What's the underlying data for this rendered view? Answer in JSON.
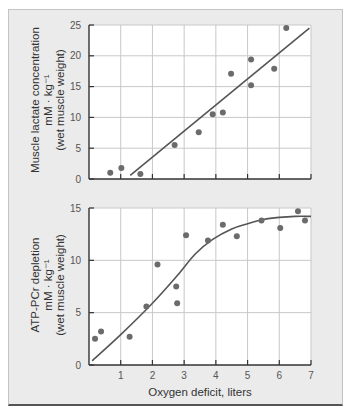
{
  "chart_data": [
    {
      "type": "scatter",
      "title": "",
      "xlabel": "Oxygen deficit, liters",
      "ylabel": [
        "Muscle lactate concentration",
        "mM · kg⁻¹",
        "(wet muscle weight)"
      ],
      "xlim": [
        0,
        7
      ],
      "ylim": [
        0,
        25
      ],
      "xticks": [
        0,
        1,
        2,
        3,
        4,
        5,
        6,
        7
      ],
      "yticks": [
        0,
        5,
        10,
        15,
        20,
        25
      ],
      "ytick_labels": [
        "0",
        "5",
        "10",
        "15",
        "20",
        "25"
      ],
      "show_xtick_labels": false,
      "grid": true,
      "points": [
        {
          "x": 0.67,
          "y": 1.0
        },
        {
          "x": 1.02,
          "y": 1.8
        },
        {
          "x": 1.62,
          "y": 0.8
        },
        {
          "x": 2.7,
          "y": 5.5
        },
        {
          "x": 3.46,
          "y": 7.6
        },
        {
          "x": 3.9,
          "y": 10.5
        },
        {
          "x": 4.22,
          "y": 10.8
        },
        {
          "x": 4.48,
          "y": 17.1
        },
        {
          "x": 5.11,
          "y": 19.4
        },
        {
          "x": 5.11,
          "y": 15.2
        },
        {
          "x": 5.84,
          "y": 17.9
        },
        {
          "x": 6.22,
          "y": 24.5
        }
      ],
      "fit": {
        "type": "linear",
        "points": [
          {
            "x": 1.3,
            "y": 0.6
          },
          {
            "x": 6.95,
            "y": 24.5
          }
        ]
      }
    },
    {
      "type": "scatter",
      "title": "",
      "xlabel": "Oxygen deficit, liters",
      "ylabel": [
        "ATP-PCr depletion",
        "mM · kg⁻¹",
        "(wet muscle weight)"
      ],
      "xlim": [
        0,
        7
      ],
      "ylim": [
        0,
        15
      ],
      "xticks": [
        0,
        1,
        2,
        3,
        4,
        5,
        6,
        7
      ],
      "xtick_labels": [
        "1",
        "2",
        "3",
        "4",
        "5",
        "6",
        "7"
      ],
      "yticks": [
        0,
        5,
        10,
        15
      ],
      "ytick_labels": [
        "0",
        "5",
        "10",
        "15"
      ],
      "grid": true,
      "points": [
        {
          "x": 0.19,
          "y": 2.5
        },
        {
          "x": 0.38,
          "y": 3.2
        },
        {
          "x": 1.28,
          "y": 2.7
        },
        {
          "x": 1.81,
          "y": 5.6
        },
        {
          "x": 2.16,
          "y": 9.6
        },
        {
          "x": 2.75,
          "y": 7.5
        },
        {
          "x": 2.78,
          "y": 5.9
        },
        {
          "x": 3.06,
          "y": 12.4
        },
        {
          "x": 3.75,
          "y": 11.9
        },
        {
          "x": 4.22,
          "y": 13.4
        },
        {
          "x": 4.66,
          "y": 12.3
        },
        {
          "x": 5.44,
          "y": 13.8
        },
        {
          "x": 6.03,
          "y": 13.1
        },
        {
          "x": 6.59,
          "y": 14.7
        },
        {
          "x": 6.81,
          "y": 13.8
        }
      ],
      "fit": {
        "type": "curve",
        "points": [
          {
            "x": 0.1,
            "y": 0.4
          },
          {
            "x": 1.0,
            "y": 2.9
          },
          {
            "x": 2.0,
            "y": 5.9
          },
          {
            "x": 2.8,
            "y": 8.6
          },
          {
            "x": 3.35,
            "y": 10.6
          },
          {
            "x": 3.9,
            "y": 12.0
          },
          {
            "x": 4.5,
            "y": 13.0
          },
          {
            "x": 5.0,
            "y": 13.5
          },
          {
            "x": 5.5,
            "y": 13.9
          },
          {
            "x": 6.0,
            "y": 14.1
          },
          {
            "x": 6.5,
            "y": 14.2
          },
          {
            "x": 7.0,
            "y": 14.2
          }
        ]
      }
    }
  ],
  "colors": {
    "frame_bg": "#ebebeb",
    "plot_bg": "#ffffff",
    "grid": "#c8c8c8",
    "axis": "#333333",
    "point": "#6b6b6b",
    "line": "#555555"
  }
}
